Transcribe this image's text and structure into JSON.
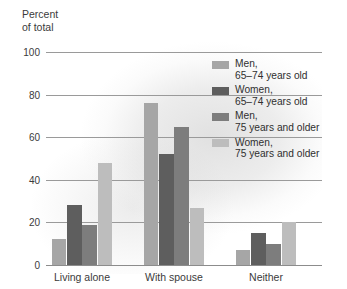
{
  "chart_data": {
    "type": "bar",
    "title": "",
    "subtitle": "",
    "ylabel": "Percent\nof total",
    "xlabel": "",
    "categories": [
      "Living alone",
      "With spouse",
      "Neither"
    ],
    "yticks": [
      0,
      20,
      40,
      60,
      80,
      100
    ],
    "ylim": [
      0,
      100
    ],
    "grid": true,
    "legend_position": "inside-top-right",
    "series": [
      {
        "name": "Men,\n65–74 years old",
        "color": "#a6a6a6",
        "values": [
          12,
          76,
          7
        ]
      },
      {
        "name": "Women,\n65–74 years old",
        "color": "#5e5e5e",
        "values": [
          28,
          52,
          15
        ]
      },
      {
        "name": "Men,\n75 years and older",
        "color": "#7d7d7d",
        "values": [
          19,
          65,
          10
        ]
      },
      {
        "name": "Women,\n75 years and older",
        "color": "#bdbdbd",
        "values": [
          48,
          27,
          20
        ]
      }
    ]
  },
  "axis": {
    "y_title": "Percent\nof total",
    "tick_0": "0",
    "tick_20": "20",
    "tick_40": "40",
    "tick_60": "60",
    "tick_80": "80",
    "tick_100": "100"
  },
  "xaxis": {
    "label_0": "Living alone",
    "label_1": "With spouse",
    "label_2": "Neither"
  },
  "legend": {
    "item_0": "Men,\n65–74 years old",
    "item_1": "Women,\n65–74 years old",
    "item_2": "Men,\n75 years and older",
    "item_3": "Women,\n75 years and older"
  }
}
